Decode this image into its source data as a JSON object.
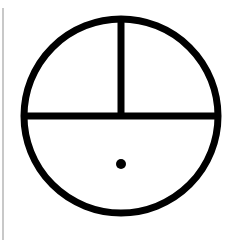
{
  "diagram": {
    "stroke_color": "#000000",
    "background_color": "#ffffff",
    "edge_line_color": "#c8c8c8",
    "circle": {
      "cx": 121,
      "cy": 116,
      "r": 97,
      "stroke_width": 7
    },
    "horizontal_line": {
      "x1": 24,
      "y1": 116,
      "x2": 218,
      "y2": 116,
      "stroke_width": 7
    },
    "vertical_line": {
      "x1": 121,
      "y1": 19,
      "x2": 121,
      "y2": 116,
      "stroke_width": 7
    },
    "dot": {
      "cx": 121,
      "cy": 164,
      "r": 5
    }
  }
}
